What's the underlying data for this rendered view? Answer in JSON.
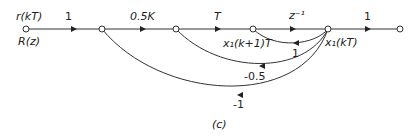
{
  "diagram": {
    "type": "signal-flow-graph",
    "caption": "(c)",
    "nodes": [
      {
        "id": "n0",
        "label_top": "r(kT)",
        "label_bottom": "R(z)"
      },
      {
        "id": "n1",
        "label": ""
      },
      {
        "id": "n2",
        "label": ""
      },
      {
        "id": "n3",
        "label": "x₁(k+1)T"
      },
      {
        "id": "n4",
        "label": "x₁(kT)"
      },
      {
        "id": "n5",
        "label": ""
      }
    ],
    "edges": [
      {
        "from": "n0",
        "to": "n1",
        "gain": "1"
      },
      {
        "from": "n1",
        "to": "n2",
        "gain": "0.5K"
      },
      {
        "from": "n2",
        "to": "n3",
        "gain": "T"
      },
      {
        "from": "n3",
        "to": "n4",
        "gain": "z⁻¹"
      },
      {
        "from": "n4",
        "to": "n5",
        "gain": "1"
      },
      {
        "from": "n4",
        "to": "n3",
        "gain": "1"
      },
      {
        "from": "n4",
        "to": "n2",
        "gain": "-0.5"
      },
      {
        "from": "n4",
        "to": "n1",
        "gain": "-1"
      }
    ]
  }
}
